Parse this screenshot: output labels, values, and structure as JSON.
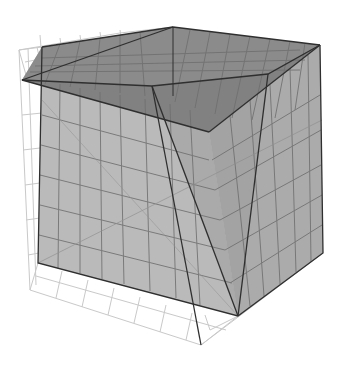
{
  "figure": {
    "colors": {
      "background": "#ffffff",
      "front_face": "#b8b8b8",
      "top_face": "#8a8a8a",
      "top_front_band": "#7c7c7c",
      "side_face": "#a9a9a9",
      "inner_wedge": "#9c9c9c",
      "edge": "#333333",
      "grid": "#6e6e6e",
      "wireframe": "#c8c8c8"
    },
    "vertices": {
      "peak": [
        173,
        27
      ],
      "top_left_back": [
        42,
        47
      ],
      "left_tip": [
        22,
        80
      ],
      "top_right": [
        320,
        45
      ],
      "front_top": [
        209,
        132
      ],
      "wedge_top_left": [
        152,
        86
      ],
      "wedge_top_right": [
        268,
        74
      ],
      "bottom_left": [
        38,
        263
      ],
      "bottom_front": [
        238,
        316
      ],
      "bottom_right": [
        323,
        253
      ],
      "wire_bottom_tip": [
        201,
        345
      ],
      "wire_top_left": [
        19,
        50
      ]
    }
  }
}
